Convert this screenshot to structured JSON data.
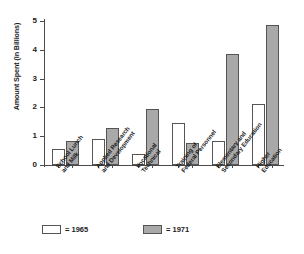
{
  "chart_data": {
    "type": "bar",
    "title": "",
    "xlabel": "",
    "ylabel": "Amount Spent (in Billions)",
    "ylim": [
      0,
      5
    ],
    "yticks": [
      "0",
      "1",
      "2",
      "3",
      "4",
      "5"
    ],
    "grid": false,
    "legend_position": "bottom-left",
    "categories": [
      "School Lunch and Milk",
      "Applied Research and Development",
      "Vocational Technical",
      "Training of Federal Personnel",
      "Elementary and Secondary Education",
      "Higher Education"
    ],
    "category_lines": [
      [
        "School Lunch",
        "and Milk"
      ],
      [
        "Applied Research",
        "and Development"
      ],
      [
        "Vocational",
        "Technical"
      ],
      [
        "Training of",
        "Federal Personnel"
      ],
      [
        "Elementary and",
        "Secondary Education"
      ],
      [
        "Higher",
        "Education"
      ]
    ],
    "series": [
      {
        "name": "1965",
        "color": "#ffffff",
        "values": [
          0.55,
          0.9,
          0.37,
          1.45,
          0.85,
          2.13
        ]
      },
      {
        "name": "1971",
        "color": "#a9a9a9",
        "values": [
          0.85,
          1.27,
          1.93,
          0.75,
          3.87,
          4.85
        ]
      }
    ]
  },
  "legend": {
    "items": [
      {
        "label": "= 1965",
        "swatch": "white-square"
      },
      {
        "label": "= 1971",
        "swatch": "gray-square"
      }
    ]
  }
}
